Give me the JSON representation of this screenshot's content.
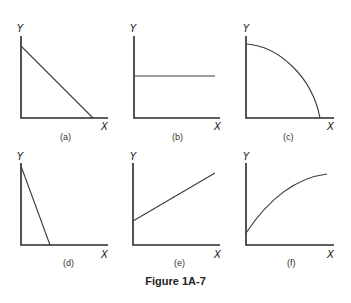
{
  "figure": {
    "caption": "Figure 1A-7"
  },
  "panels": [
    {
      "id": "a",
      "label": "(a)",
      "x_axis": "X",
      "y_axis": "Y",
      "shape": "straight line, negative slope, from high Y-intercept to X-intercept"
    },
    {
      "id": "b",
      "label": "(b)",
      "x_axis": "X",
      "y_axis": "Y",
      "shape": "horizontal line (constant Y)"
    },
    {
      "id": "c",
      "label": "(c)",
      "x_axis": "X",
      "y_axis": "Y",
      "shape": "concave curve bowed outward, decreasing to X-axis"
    },
    {
      "id": "d",
      "label": "(d)",
      "x_axis": "X",
      "y_axis": "Y",
      "shape": "steep straight line, negative slope"
    },
    {
      "id": "e",
      "label": "(e)",
      "x_axis": "X",
      "y_axis": "Y",
      "shape": "straight line, positive slope, positive Y-intercept"
    },
    {
      "id": "f",
      "label": "(f)",
      "x_axis": "X",
      "y_axis": "Y",
      "shape": "increasing concave curve, positive Y-intercept"
    }
  ]
}
